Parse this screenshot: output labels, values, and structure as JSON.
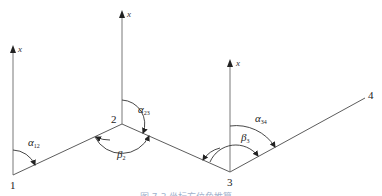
{
  "diagram": {
    "type": "traverse-azimuth-diagram",
    "points": [
      {
        "id": "1",
        "label": "1",
        "x": 13,
        "y": 175
      },
      {
        "id": "2",
        "label": "2",
        "x": 122,
        "y": 124
      },
      {
        "id": "3",
        "label": "3",
        "x": 230,
        "y": 172
      },
      {
        "id": "4",
        "label": "4",
        "x": 365,
        "y": 98
      }
    ],
    "north_axes": [
      {
        "at": "1",
        "label": "x"
      },
      {
        "at": "2",
        "label": "x"
      },
      {
        "at": "3",
        "label": "x"
      }
    ],
    "azimuth_angles": [
      {
        "symbol": "α",
        "subscript": "12"
      },
      {
        "symbol": "α",
        "subscript": "23"
      },
      {
        "symbol": "α",
        "subscript": "34"
      }
    ],
    "turning_angles": [
      {
        "symbol": "β",
        "subscript": "2"
      },
      {
        "symbol": "β",
        "subscript": "3"
      }
    ],
    "colors": {
      "line": "#4a4a4a",
      "axis": "#6a6a6a",
      "caption": "#9fb2cc"
    }
  },
  "caption": "图 7-3  坐标方位角推算"
}
